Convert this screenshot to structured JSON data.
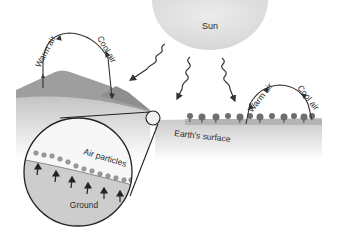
{
  "diagram": {
    "labels": {
      "sun": "Sun",
      "warm_air_left": "Warm air",
      "cool_air_left": "Cool air",
      "warm_air_right": "Warm air",
      "cool_air_right": "Cool air",
      "earths_surface": "Earth's surface",
      "air_particles": "Air particles",
      "ground": "Ground"
    },
    "colors": {
      "sun_fill": "#e4e4e4",
      "hill": "#9a9a9a",
      "ground_band": "#c9c9c9",
      "arrow": "#333333",
      "particle": "#9c9c9c"
    },
    "sun_rays": 3,
    "particles_count": 14,
    "heat_arrows_count": 6
  }
}
